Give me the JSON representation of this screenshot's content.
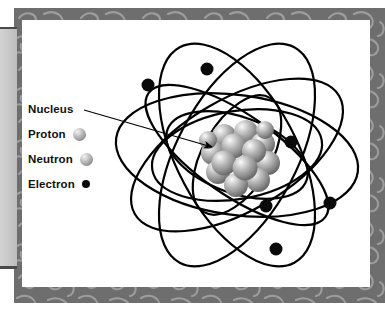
{
  "figure": {
    "background_color": "#ffffff",
    "frame_color": "#6e6e6e",
    "panel_color": "#ffffff",
    "tab_color": "#c6c6c6"
  },
  "legend": {
    "items": [
      {
        "label": "Nucleus",
        "marker": "callout-arrow",
        "marker_color": "#000000"
      },
      {
        "label": "Proton",
        "marker": "gray-sphere",
        "marker_color": "#b0b0b0"
      },
      {
        "label": "Neutron",
        "marker": "gray-sphere",
        "marker_color": "#b0b0b0"
      },
      {
        "label": "Electron",
        "marker": "black-dot",
        "marker_color": "#0a0a0a"
      }
    ]
  },
  "diagram": {
    "center": {
      "x": 215,
      "y": 135
    },
    "nucleus": {
      "label": "Nucleus",
      "particle_count": 14,
      "radius": 31,
      "color": "#b4b4b4"
    },
    "callout": {
      "label": "Nucleus",
      "line_from": {
        "x": 62,
        "y": 90
      },
      "line_to": {
        "x": 190,
        "y": 127
      },
      "arrowhead": "triangle"
    },
    "orbits": [
      {
        "rx": 122,
        "ry": 60,
        "rotation": 8,
        "stroke": "#000000",
        "stroke_width": 2.2
      },
      {
        "rx": 122,
        "ry": 60,
        "rotation": 62,
        "stroke": "#000000",
        "stroke_width": 2.2
      },
      {
        "rx": 122,
        "ry": 60,
        "rotation": 118,
        "stroke": "#000000",
        "stroke_width": 2.2
      },
      {
        "rx": 118,
        "ry": 56,
        "rotation": 150,
        "stroke": "#000000",
        "stroke_width": 2.2
      },
      {
        "rx": 108,
        "ry": 40,
        "rotation": 35,
        "stroke": "#000000",
        "stroke_width": 2.2
      },
      {
        "rx": 86,
        "ry": 44,
        "rotation": 170,
        "stroke": "#000000",
        "stroke_width": 2.2
      },
      {
        "rx": 74,
        "ry": 38,
        "rotation": 20,
        "stroke": "#000000",
        "stroke_width": 2.2
      },
      {
        "rx": 66,
        "ry": 34,
        "rotation": 120,
        "stroke": "#000000",
        "stroke_width": 2.2
      }
    ],
    "electrons": [
      {
        "x": 126,
        "y": 65,
        "r": 6.5
      },
      {
        "x": 185,
        "y": 49,
        "r": 6.5
      },
      {
        "x": 269,
        "y": 122,
        "r": 6.5
      },
      {
        "x": 308,
        "y": 183,
        "r": 6.5
      },
      {
        "x": 244,
        "y": 186,
        "r": 6.5
      },
      {
        "x": 254,
        "y": 229,
        "r": 6.5
      }
    ]
  }
}
